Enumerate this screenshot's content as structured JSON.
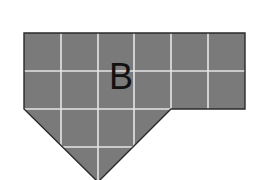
{
  "figure": {
    "label": "B",
    "colors": {
      "fill": "#7a7a7a",
      "outline": "#2a2a2a",
      "grid": "#e6e6e6",
      "label": "#111111",
      "background": "#ffffff"
    },
    "grid": {
      "cell_size": 37,
      "columns": 6,
      "rows": 4
    }
  }
}
